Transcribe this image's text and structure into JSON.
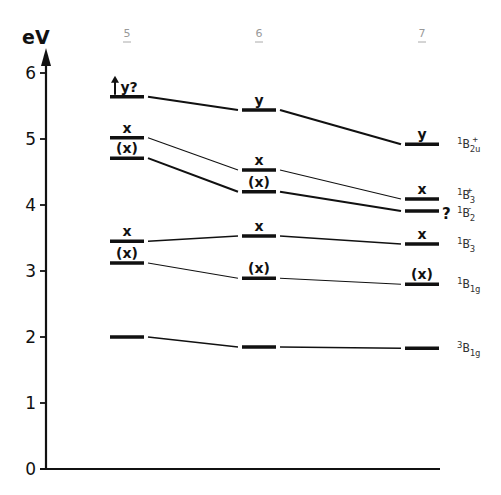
{
  "chart_data": {
    "type": "energy-level-diagram",
    "title": "",
    "ylabel": "eV",
    "ylim": [
      0,
      6.3
    ],
    "yticks": [
      0,
      1,
      2,
      3,
      4,
      5,
      6
    ],
    "grid": false,
    "columns": [
      {
        "label": "5",
        "x_center": 127
      },
      {
        "label": "6",
        "x_center": 259
      },
      {
        "label": "7",
        "x_center": 422
      }
    ],
    "levels": [
      {
        "id": "L1",
        "column": 0,
        "value": 5.64,
        "annotation": "y?",
        "arrow_up": true
      },
      {
        "id": "L2",
        "column": 0,
        "value": 5.02,
        "annotation": "x"
      },
      {
        "id": "L3",
        "column": 0,
        "value": 4.71,
        "annotation": "(x)"
      },
      {
        "id": "L4",
        "column": 0,
        "value": 3.45,
        "annotation": "x"
      },
      {
        "id": "L5",
        "column": 0,
        "value": 3.12,
        "annotation": "(x)"
      },
      {
        "id": "L6",
        "column": 0,
        "value": 2.0,
        "annotation": ""
      },
      {
        "id": "M1",
        "column": 1,
        "value": 5.44,
        "annotation": "y"
      },
      {
        "id": "M2",
        "column": 1,
        "value": 4.53,
        "annotation": "x"
      },
      {
        "id": "M3",
        "column": 1,
        "value": 4.2,
        "annotation": "(x)"
      },
      {
        "id": "M4",
        "column": 1,
        "value": 3.53,
        "annotation": "x"
      },
      {
        "id": "M5",
        "column": 1,
        "value": 2.89,
        "annotation": "(x)"
      },
      {
        "id": "M6",
        "column": 1,
        "value": 1.85,
        "annotation": ""
      },
      {
        "id": "R1",
        "column": 2,
        "value": 4.92,
        "annotation": "y",
        "state": "1B2u+"
      },
      {
        "id": "R2",
        "column": 2,
        "value": 4.09,
        "annotation": "x",
        "state": "1B3+"
      },
      {
        "id": "R3",
        "column": 2,
        "value": 3.91,
        "annotation": "",
        "state": "1B2-",
        "question": "?"
      },
      {
        "id": "R4",
        "column": 2,
        "value": 3.41,
        "annotation": "x",
        "state": "1B3-"
      },
      {
        "id": "R5",
        "column": 2,
        "value": 2.8,
        "annotation": "(x)",
        "state": "1B1g"
      },
      {
        "id": "R6",
        "column": 2,
        "value": 1.83,
        "annotation": "",
        "state": "3B1g"
      }
    ],
    "series": [
      {
        "name": "1B2u+",
        "values": [
          5.64,
          5.44,
          4.92
        ],
        "weight": "thick"
      },
      {
        "name": "1B3+",
        "values": [
          5.02,
          4.53,
          4.09
        ],
        "weight": "thin"
      },
      {
        "name": "1B2-",
        "values": [
          4.71,
          4.2,
          3.91
        ],
        "weight": "thick"
      },
      {
        "name": "1B3-",
        "values": [
          3.45,
          3.53,
          3.41
        ],
        "weight": "medium"
      },
      {
        "name": "1B1g",
        "values": [
          3.12,
          2.89,
          2.8
        ],
        "weight": "thin"
      },
      {
        "name": "3B1g",
        "values": [
          2.0,
          1.85,
          1.83
        ],
        "weight": "medium"
      }
    ],
    "state_labels": [
      {
        "sup": "1",
        "base": "B",
        "sub": "2u",
        "charge": "+",
        "value": 4.92
      },
      {
        "sup": "1",
        "base": "B",
        "sub": "3",
        "charge": "+",
        "value": 4.09
      },
      {
        "sup": "1",
        "base": "B",
        "sub": "2",
        "charge": "-",
        "value": 3.91
      },
      {
        "sup": "1",
        "base": "B",
        "sub": "3",
        "charge": "-",
        "value": 3.41
      },
      {
        "sup": "1",
        "base": "B",
        "sub": "1g",
        "charge": "",
        "value": 2.8
      },
      {
        "sup": "3",
        "base": "B",
        "sub": "1g",
        "charge": "",
        "value": 1.83
      }
    ]
  }
}
